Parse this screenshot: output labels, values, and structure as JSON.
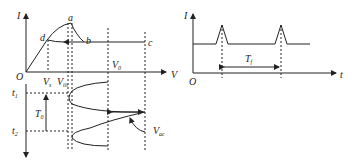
{
  "left_diagram": {
    "y_axis_label": "I",
    "x_axis_label": "V",
    "origin_label": "O",
    "points": {
      "a": "a",
      "b": "b",
      "c": "c",
      "d": "d"
    },
    "v_labels": {
      "vs": "V",
      "vs_sub": "s",
      "vth": "V",
      "vth_sub": "th",
      "v0": "V",
      "v0_sub": "0"
    },
    "time_labels": {
      "t1": "t",
      "t1_sub": "1",
      "t2": "t",
      "t2_sub": "2"
    },
    "period_label": "T",
    "period_sub": "0",
    "vac_label": "V",
    "vac_sub": "ac"
  },
  "right_diagram": {
    "y_axis_label": "I",
    "x_axis_label": "t",
    "origin_label": "O",
    "period_label": "T",
    "period_sub": "f"
  }
}
